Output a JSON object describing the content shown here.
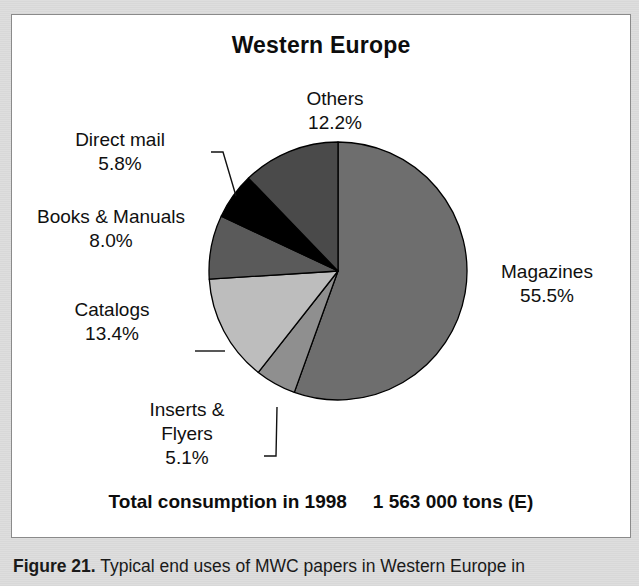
{
  "figure": {
    "title": "Western Europe",
    "total_label": "Total consumption in 1998",
    "total_value": "1 563 000 tons (E)",
    "caption_number": "Figure 21.",
    "caption_text": "Typical end uses of MWC papers in Western Europe in"
  },
  "labels": {
    "magazines": {
      "name": "Magazines",
      "pct": "55.5%"
    },
    "inserts": {
      "name_line1": "Inserts &",
      "name_line2": "Flyers",
      "pct": "5.1%"
    },
    "catalogs": {
      "name": "Catalogs",
      "pct": "13.4%"
    },
    "books": {
      "name": "Books & Manuals",
      "pct": "8.0%"
    },
    "directmail": {
      "name": "Direct mail",
      "pct": "5.8%"
    },
    "others": {
      "name": "Others",
      "pct": "12.2%"
    }
  },
  "colors": {
    "magazines": "#6e6e6e",
    "inserts": "#8f8f8f",
    "catalogs": "#bdbdbd",
    "books": "#5a5a5a",
    "directmail": "#000000",
    "others": "#4a4a4a",
    "outline": "#000000",
    "panel_bg": "#ffffff",
    "page_bg": "#dddddd"
  },
  "chart_data": {
    "type": "pie",
    "title": "Western Europe",
    "subtitle": "Total consumption in 1998    1 563 000 tons (E)",
    "unit": "percent of total consumption",
    "total_consumption_tons": 1563000,
    "total_consumption_display": "1 563 000 tons (E)",
    "year": 1998,
    "region": "Western Europe",
    "start_angle_deg": 0,
    "direction": "clockwise",
    "legend": "none (direct labels with leader lines)",
    "categories": [
      "Magazines",
      "Inserts & Flyers",
      "Catalogs",
      "Books & Manuals",
      "Direct mail",
      "Others"
    ],
    "values": [
      55.5,
      5.1,
      13.4,
      8.0,
      5.8,
      12.2
    ],
    "slices": [
      {
        "label": "Magazines",
        "value": 55.5,
        "color": "#6e6e6e",
        "start_deg": 0.0,
        "sweep_deg": 199.8
      },
      {
        "label": "Inserts & Flyers",
        "value": 5.1,
        "color": "#8f8f8f",
        "start_deg": 199.8,
        "sweep_deg": 18.36
      },
      {
        "label": "Catalogs",
        "value": 13.4,
        "color": "#bdbdbd",
        "start_deg": 218.16,
        "sweep_deg": 48.24
      },
      {
        "label": "Books & Manuals",
        "value": 8.0,
        "color": "#5a5a5a",
        "start_deg": 266.4,
        "sweep_deg": 28.8
      },
      {
        "label": "Direct mail",
        "value": 5.8,
        "color": "#000000",
        "start_deg": 295.2,
        "sweep_deg": 20.88
      },
      {
        "label": "Others",
        "value": 12.2,
        "color": "#4a4a4a",
        "start_deg": 316.08,
        "sweep_deg": 43.92
      }
    ]
  }
}
